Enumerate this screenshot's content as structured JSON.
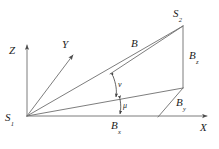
{
  "figure": {
    "background_color": "#ffffff",
    "line_color": "#6e6e6e",
    "text_color": "#1c1c1c",
    "axes": {
      "x": {
        "label": "X",
        "sub": ""
      },
      "y": {
        "label": "Y",
        "sub": ""
      },
      "z": {
        "label": "Z",
        "sub": ""
      }
    },
    "points": {
      "origin": {
        "label": "S",
        "sub": "1"
      },
      "far": {
        "label": "S",
        "sub": "2"
      }
    },
    "vectors": {
      "baseline": {
        "label": "B",
        "sub": ""
      },
      "bz": {
        "label": "B",
        "sub": "z"
      },
      "by": {
        "label": "B",
        "sub": "y"
      },
      "bx": {
        "label": "B",
        "sub": "x"
      }
    },
    "angles": {
      "nu": {
        "label": "ν"
      },
      "mu": {
        "label": "μ"
      }
    }
  }
}
